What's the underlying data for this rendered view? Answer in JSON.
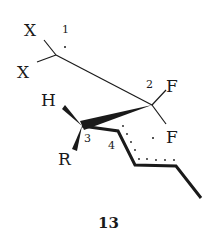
{
  "diagram": {
    "type": "chemical-structure",
    "compound_label": "13",
    "atoms": [
      {
        "id": "X_top",
        "label": "X",
        "x": 33,
        "y": 36
      },
      {
        "id": "X_bottom",
        "label": "X",
        "x": 25,
        "y": 78
      },
      {
        "id": "H",
        "label": "H",
        "x": 50,
        "y": 106
      },
      {
        "id": "R",
        "label": "R",
        "x": 66,
        "y": 164
      },
      {
        "id": "F_top",
        "label": "F",
        "x": 172,
        "y": 91
      },
      {
        "id": "F_bottom",
        "label": "F",
        "x": 173,
        "y": 143
      }
    ],
    "position_numbers": [
      {
        "label": "1",
        "x": 66,
        "y": 33
      },
      {
        "label": "2",
        "x": 150,
        "y": 88
      },
      {
        "label": "3",
        "x": 87,
        "y": 142
      },
      {
        "label": "4",
        "x": 112,
        "y": 149
      }
    ],
    "colors": {
      "ink": "#1a1a1a",
      "background": "#ffffff"
    }
  }
}
